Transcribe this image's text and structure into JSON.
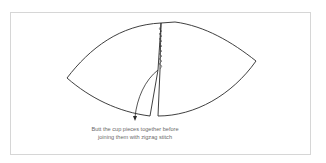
{
  "figure": {
    "caption_lines": [
      "Butt the cup pieces together before",
      "joining them with zigzag stitch"
    ],
    "stroke_color": "#2a2a2a",
    "frame_color": "#d6d6d6",
    "caption_color": "#6a6a6a"
  }
}
